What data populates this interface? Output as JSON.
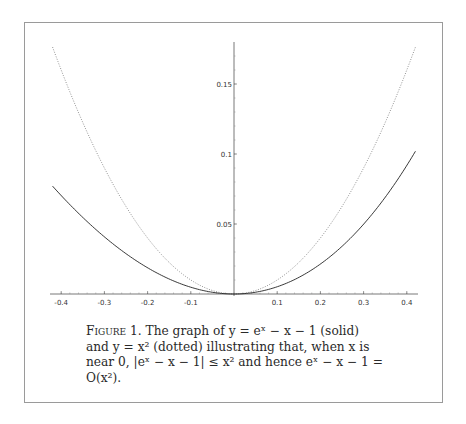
{
  "figure": {
    "label": "Figure 1.",
    "caption_line1": "The graph of y = eˣ − x − 1 (solid)",
    "caption_line2": "and y = x² (dotted) illustrating that, when x is",
    "caption_line3": "near 0, |eˣ − x − 1| ≤ x² and hence eˣ − x − 1 =",
    "caption_line4": "O(x²)."
  },
  "chart_data": {
    "type": "line",
    "title": "",
    "xlabel": "",
    "ylabel": "",
    "xlim": [
      -0.42,
      0.42
    ],
    "ylim": [
      0,
      0.18
    ],
    "grid": false,
    "legend": null,
    "x_ticks": [
      "-0.4",
      "-0.3",
      "-0.2",
      "-0.1",
      "0.1",
      "0.2",
      "0.3",
      "0.4"
    ],
    "y_ticks": [
      "0.05",
      "0.1",
      "0.15"
    ],
    "x": [
      -0.42,
      -0.4,
      -0.35,
      -0.3,
      -0.25,
      -0.2,
      -0.15,
      -0.1,
      -0.05,
      0,
      0.05,
      0.1,
      0.15,
      0.2,
      0.25,
      0.3,
      0.35,
      0.4,
      0.42
    ],
    "series": [
      {
        "name": "y = e^x - x - 1",
        "style": "solid",
        "values": [
          0.077,
          0.0703,
          0.0547,
          0.0408,
          0.0288,
          0.0187,
          0.0107,
          0.0048,
          0.0012,
          0,
          0.0013,
          0.0052,
          0.0118,
          0.0214,
          0.034,
          0.0499,
          0.0691,
          0.0918,
          0.102
        ]
      },
      {
        "name": "y = x^2",
        "style": "dotted",
        "values": [
          0.1764,
          0.16,
          0.1225,
          0.09,
          0.0625,
          0.04,
          0.0225,
          0.01,
          0.0025,
          0,
          0.0025,
          0.01,
          0.0225,
          0.04,
          0.0625,
          0.09,
          0.1225,
          0.16,
          0.1764
        ]
      }
    ]
  }
}
